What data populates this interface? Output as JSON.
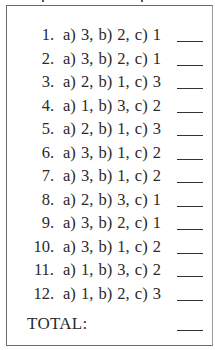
{
  "answer_key": {
    "rows": [
      {
        "number": "1.",
        "answer": "a) 3,  b) 2,  c) 1"
      },
      {
        "number": "2.",
        "answer": "a) 3,  b) 2,  c) 1"
      },
      {
        "number": "3.",
        "answer": "a) 2,  b) 1,  c) 3"
      },
      {
        "number": "4.",
        "answer": "a) 1,  b) 3,  c) 2"
      },
      {
        "number": "5.",
        "answer": "a) 2,  b) 1,  c) 3"
      },
      {
        "number": "6.",
        "answer": "a) 3,  b) 1,  c) 2"
      },
      {
        "number": "7.",
        "answer": "a) 3,  b) 1,  c) 2"
      },
      {
        "number": "8.",
        "answer": "a) 2,  b) 3,  c) 1"
      },
      {
        "number": "9.",
        "answer": "a) 3,  b) 2,  c) 1"
      },
      {
        "number": "10.",
        "answer": "a) 3,  b) 1,  c) 2"
      },
      {
        "number": "11.",
        "answer": "a) 1,  b) 3,  c) 2"
      },
      {
        "number": "12.",
        "answer": "a) 1,  b) 2,  c) 3"
      }
    ],
    "total_label": "TOTAL:"
  }
}
